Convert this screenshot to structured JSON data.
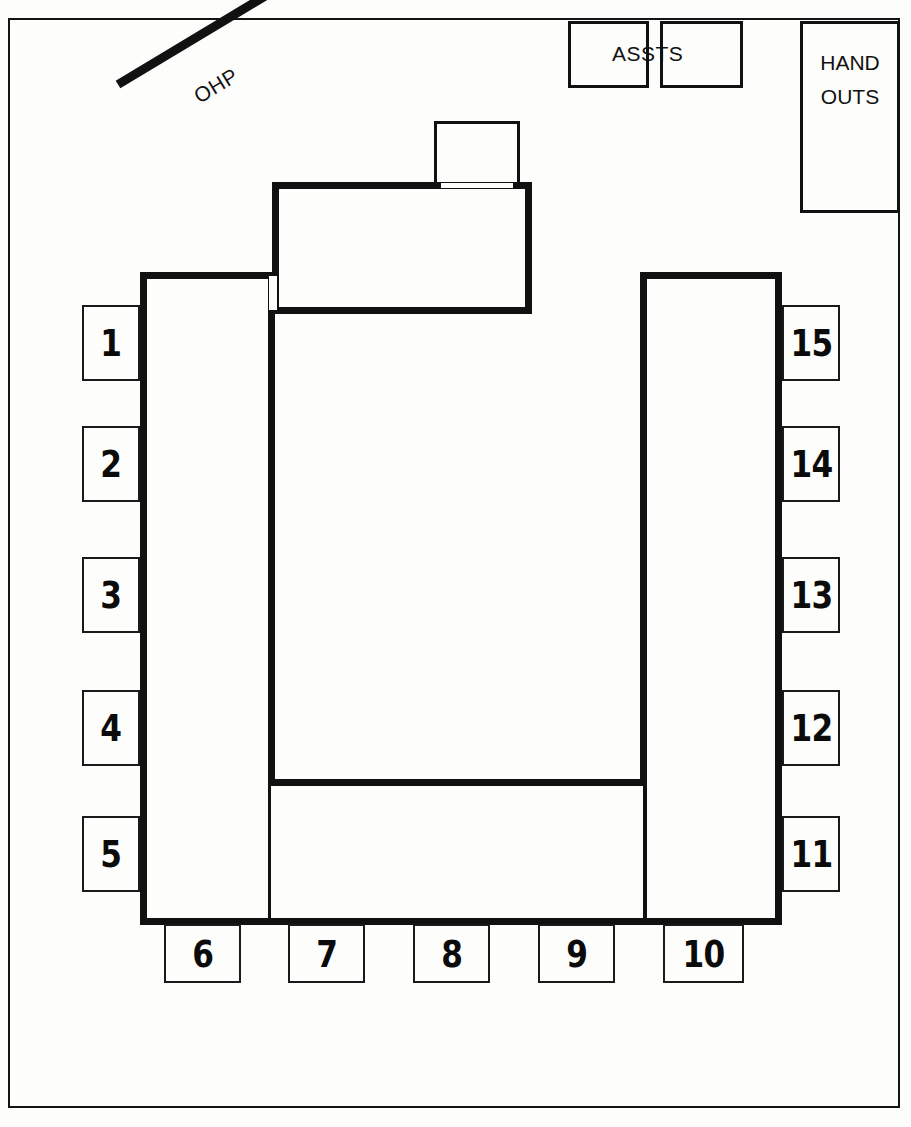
{
  "plan": {
    "title": "Seminar Room Seating Layout",
    "width": 911,
    "height": 1127,
    "ink_color": "#111111",
    "paper_color": "#fdfdfc"
  },
  "equipment": {
    "ohp": {
      "label": "OHP",
      "name": "overhead-projector"
    },
    "assistants": {
      "label": "ASSTS",
      "name": "assistants-tables",
      "boxes": 2
    },
    "handouts": {
      "line1": "HAND",
      "line2": "OUTS",
      "name": "handouts-table"
    }
  },
  "furniture": {
    "head_table": {
      "name": "head-table",
      "label": ""
    },
    "presenter_chair": {
      "name": "presenter-chair",
      "label": ""
    },
    "left_arm": {
      "name": "table-left-arm",
      "label": ""
    },
    "right_arm": {
      "name": "table-right-arm",
      "label": ""
    },
    "bottom_table": {
      "name": "table-bottom-run",
      "label": ""
    }
  },
  "seats": {
    "left_column": [
      {
        "number": "1"
      },
      {
        "number": "2"
      },
      {
        "number": "3"
      },
      {
        "number": "4"
      },
      {
        "number": "5"
      }
    ],
    "bottom_row": [
      {
        "number": "6"
      },
      {
        "number": "7"
      },
      {
        "number": "8"
      },
      {
        "number": "9"
      },
      {
        "number": "10"
      }
    ],
    "right_column": [
      {
        "number": "15"
      },
      {
        "number": "14"
      },
      {
        "number": "13"
      },
      {
        "number": "12"
      },
      {
        "number": "11"
      }
    ]
  }
}
